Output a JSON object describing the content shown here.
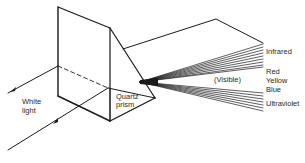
{
  "diagram": {
    "input_label_line1": "White",
    "input_label_line2": "light",
    "prism_label_line1": "Quartz",
    "prism_label_line2": "prism",
    "visible_label": "(Visible)",
    "spectrum_labels": {
      "infrared": "Infrared",
      "red": "Red",
      "yellow": "Yellow",
      "blue": "Blue",
      "ultraviolet": "Ultraviolet"
    },
    "colors": {
      "line": "#1a1a1a",
      "text": "#2a2a2a",
      "background": "#ffffff"
    }
  }
}
